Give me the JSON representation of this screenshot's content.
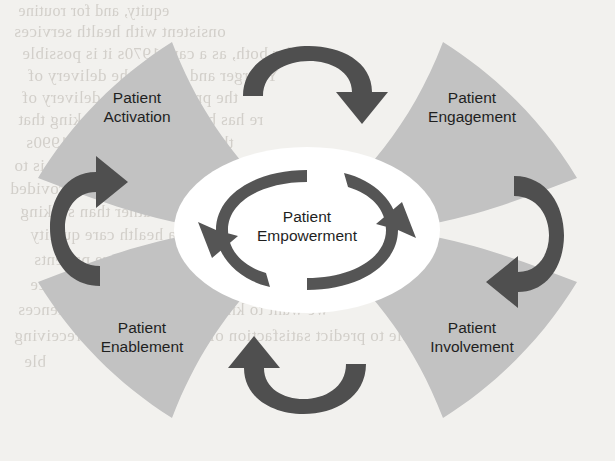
{
  "diagram": {
    "title": "Patient Empowerment",
    "type": "cycle-diagram",
    "center": {
      "label_line1": "Patient",
      "label_line2": "Empowerment",
      "shape": "ellipse",
      "fill": "#ffffff"
    },
    "quadrants": [
      {
        "id": "activation",
        "position": "top-left",
        "label_line1": "Patient",
        "label_line2": "Activation",
        "fill": "#c2c2c2"
      },
      {
        "id": "engagement",
        "position": "top-right",
        "label_line1": "Patient",
        "label_line2": "Engagement",
        "fill": "#c2c2c2"
      },
      {
        "id": "enablement",
        "position": "bottom-left",
        "label_line1": "Patient",
        "label_line2": "Enablement",
        "fill": "#c2c2c2"
      },
      {
        "id": "involvement",
        "position": "bottom-right",
        "label_line1": "Patient",
        "label_line2": "Involvement",
        "fill": "#c2c2c2"
      }
    ],
    "arrows": [
      {
        "id": "arrow-top",
        "from": "activation",
        "to": "engagement",
        "direction": "clockwise",
        "color": "#4f4f4f"
      },
      {
        "id": "arrow-right",
        "from": "engagement",
        "to": "involvement",
        "direction": "clockwise",
        "color": "#4f4f4f"
      },
      {
        "id": "arrow-bottom",
        "from": "involvement",
        "to": "enablement",
        "direction": "clockwise",
        "color": "#4f4f4f"
      },
      {
        "id": "arrow-left",
        "from": "enablement",
        "to": "activation",
        "direction": "clockwise",
        "color": "#4f4f4f"
      },
      {
        "id": "arrow-center-left",
        "from": "center",
        "to": "center",
        "direction": "counter-clockwise",
        "color": "#555555"
      },
      {
        "id": "arrow-center-right",
        "from": "center",
        "to": "center",
        "direction": "counter-clockwise",
        "color": "#555555"
      }
    ],
    "colors": {
      "wedge_fill": "#c2c2c2",
      "arrow_dark": "#4f4f4f",
      "center_fill": "#ffffff",
      "text": "#1f1f1f",
      "page_background": "#f2f1ee"
    }
  },
  "background_text": {
    "note": "faint show-through text from reverse of scanned page",
    "lines": [
      "equity, and for routine",
      "onsistent with health services",
      "ble",
      "it for both, as a care 1970s it is possible",
      "Y larger and still of the delivery of",
      "the provider to the delivery of",
      "re has been a shift in thinking that",
      "the care process in the 1990s",
      "se patient to have a voice is to",
      "d to increase the quality of care provided",
      "They give the patient rather than seeking",
      "r a health care quality",
      "ve patients",
      "may influence",
      "we want to know about patient experiences",
      "unable to predict satisfaction of the care they are receiving"
    ]
  }
}
